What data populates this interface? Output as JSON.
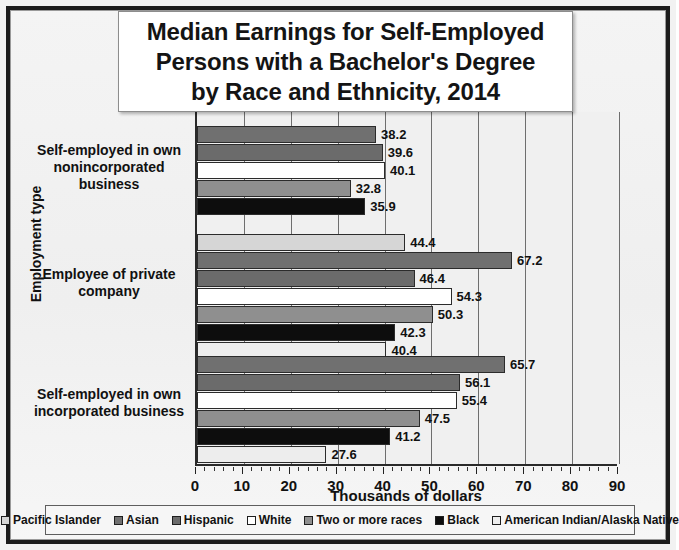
{
  "chart_data": {
    "type": "bar",
    "orientation": "horizontal",
    "title": "Median Earnings for Self-Employed Persons with a Bachelor's Degree by Race and Ethnicity, 2014",
    "title_lines": [
      "Median Earnings for Self-Employed",
      "Persons with a Bachelor's Degree",
      "by Race and Ethnicity, 2014"
    ],
    "xlabel": "Thousands of dollars",
    "ylabel": "Employment type",
    "xlim": [
      0,
      90
    ],
    "xticks": [
      0,
      10,
      20,
      30,
      40,
      50,
      60,
      70,
      80,
      90
    ],
    "xtick_labels": [
      "0",
      "10",
      "20",
      "30",
      "40",
      "50",
      "60",
      "70",
      "80",
      "90"
    ],
    "minor_tick_step": 2,
    "grid": true,
    "legend_position": "bottom",
    "categories": [
      "Self-employed in own nonincorporated business",
      "Employee of private company",
      "Self-employed in own incorporated business"
    ],
    "category_label_lines": [
      [
        "Self-employed in own",
        "nonincorporated business"
      ],
      [
        "Employee of private",
        "company"
      ],
      [
        "Self-employed in own",
        "incorporated business"
      ]
    ],
    "series": [
      {
        "name": "Pacific Islander",
        "color": "#d6d6d6",
        "values": [
          null,
          44.4,
          null
        ]
      },
      {
        "name": "Asian",
        "color": "#707070",
        "values": [
          38.2,
          67.2,
          65.7
        ]
      },
      {
        "name": "Hispanic",
        "color": "#6b6b6b",
        "values": [
          39.6,
          46.4,
          56.1
        ]
      },
      {
        "name": "White",
        "color": "#ffffff",
        "values": [
          40.1,
          54.3,
          55.4
        ]
      },
      {
        "name": "Two or more races",
        "color": "#8f8f8f",
        "values": [
          32.8,
          50.3,
          47.5
        ]
      },
      {
        "name": "Black",
        "color": "#0d0d0d",
        "values": [
          35.9,
          42.3,
          41.2
        ]
      },
      {
        "name": "American Indian/Alaska Native",
        "color": "#ededed",
        "values": [
          null,
          40.4,
          27.6
        ]
      }
    ],
    "data_labels": {
      "group1": [
        "38.2",
        "39.6",
        "40.1",
        "32.8",
        "35.9"
      ],
      "group2": [
        "44.4",
        "67.2",
        "46.4",
        "54.3",
        "50.3",
        "42.3",
        "40.4"
      ],
      "group3": [
        "65.7",
        "56.1",
        "55.4",
        "47.5",
        "41.2",
        "27.6"
      ]
    }
  },
  "legend": {
    "items": [
      {
        "label": "Pacific Islander",
        "color": "#d6d6d6"
      },
      {
        "label": "Asian",
        "color": "#707070"
      },
      {
        "label": "Hispanic",
        "color": "#6b6b6b"
      },
      {
        "label": "White",
        "color": "#ffffff"
      },
      {
        "label": "Two or more races",
        "color": "#8f8f8f"
      },
      {
        "label": "Black",
        "color": "#0d0d0d"
      },
      {
        "label": "American Indian/Alaska Native",
        "color": "#ededed"
      }
    ]
  }
}
